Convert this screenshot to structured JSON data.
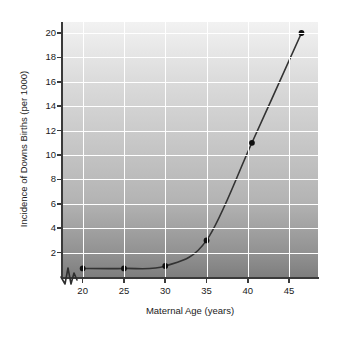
{
  "chart_data": {
    "type": "line",
    "title": "",
    "xlabel": "Maternal Age (years)",
    "ylabel": "Incidence of Downs Births (per 1000)",
    "x": [
      20,
      25,
      30,
      35,
      40.5,
      46.5
    ],
    "values": [
      0.7,
      0.7,
      0.9,
      3.0,
      11.0,
      20.0
    ],
    "series": [
      {
        "name": "Incidence of Downs Births",
        "x": [
          20,
          25,
          30,
          35,
          40.5,
          46.5
        ],
        "values": [
          0.7,
          0.7,
          0.9,
          3.0,
          11.0,
          20.0
        ]
      }
    ],
    "xlim": [
      17.5,
      48.5
    ],
    "ylim": [
      0,
      20.9
    ],
    "xticks": [
      20,
      25,
      30,
      35,
      40,
      45
    ],
    "xtick_labels": [
      "20",
      "25",
      "30",
      "35",
      "40",
      "45"
    ],
    "yticks": [
      2,
      4,
      6,
      8,
      10,
      12,
      14,
      16,
      18,
      20
    ],
    "ytick_labels": [
      "2",
      "4",
      "6",
      "8",
      "10",
      "12",
      "14",
      "16",
      "18",
      "20"
    ],
    "grid": true,
    "grid_color": "#ffffff",
    "legend": false,
    "legend_position": "none",
    "marker": "circle",
    "marker_color": "#111111",
    "line_color": "#333333",
    "axis_break": true,
    "axis_break_axis": "x",
    "background_gradient_top": "#f2f2f2",
    "background_gradient_bottom": "#7e7e7e",
    "annotations": []
  }
}
